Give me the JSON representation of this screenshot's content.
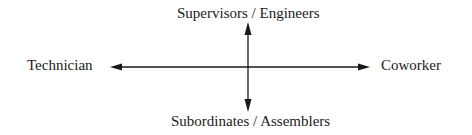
{
  "diagram": {
    "type": "two-axis orientation diagram",
    "labels": {
      "top": "Supervisors / Engineers",
      "bottom": "Subordinates / Assemblers",
      "left": "Technician",
      "right": "Coworker"
    },
    "axes": {
      "vertical": {
        "direction": "bidirectional",
        "from": "Supervisors / Engineers",
        "to": "Subordinates / Assemblers"
      },
      "horizontal": {
        "direction": "bidirectional",
        "from": "Technician",
        "to": "Coworker"
      }
    },
    "colors": {
      "line": "#1a1a1a",
      "background": "#ffffff"
    }
  }
}
